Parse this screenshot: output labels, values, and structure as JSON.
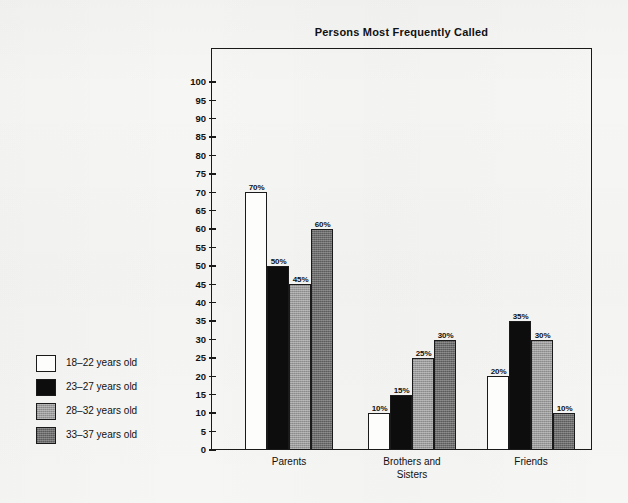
{
  "chart_data": {
    "type": "bar",
    "title": "Persons Most Frequently Called",
    "xlabel": "",
    "ylabel": "",
    "ylim": [
      0,
      100
    ],
    "y_ticks": [
      0,
      5,
      10,
      15,
      20,
      25,
      30,
      35,
      40,
      45,
      50,
      55,
      60,
      65,
      70,
      75,
      80,
      85,
      90,
      95,
      100
    ],
    "grid": false,
    "legend_position": "left-outside",
    "value_label_suffix": "%",
    "categories": [
      "Parents",
      "Brothers and\nSisters",
      "Friends"
    ],
    "series": [
      {
        "name": "18–22 years old",
        "color": "#fdfdfb",
        "values": [
          70,
          10,
          20
        ],
        "value_labels": [
          "70%",
          "10%",
          "20%"
        ]
      },
      {
        "name": "23–27 years old",
        "color": "#0d0d0d",
        "values": [
          50,
          15,
          35
        ],
        "value_labels": [
          "50%",
          "15%",
          "35%"
        ]
      },
      {
        "name": "28–32 years old",
        "color": "#9b9b9b",
        "values": [
          45,
          25,
          30
        ],
        "value_labels": [
          "45%",
          "25%",
          "30%"
        ]
      },
      {
        "name": "33–37 years old",
        "color": "#6d6d6d",
        "values": [
          60,
          30,
          10
        ],
        "value_labels": [
          "60%",
          "30%",
          "10%"
        ]
      }
    ]
  },
  "legend": {
    "items": [
      {
        "label": "18–22 years old",
        "swatch": "white-swatch"
      },
      {
        "label": "23–27 years old",
        "swatch": "black-swatch"
      },
      {
        "label": "28–32 years old",
        "swatch": "light-gray-swatch"
      },
      {
        "label": "33–37 years old",
        "swatch": "dark-gray-swatch"
      }
    ]
  },
  "colors": {
    "background": "#f6f6f4",
    "ink": "#1a1a1a",
    "series_1": "#fdfdfb",
    "series_2": "#0d0d0d",
    "series_3": "#9b9b9b",
    "series_4": "#6d6d6d"
  }
}
